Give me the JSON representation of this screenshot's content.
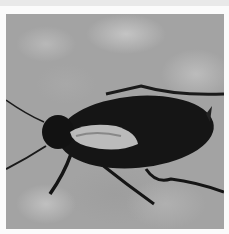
{
  "image": {
    "subject": "cockroach",
    "description": "Black-and-white photograph of a dark cockroach on a mottled stone surface, with a white border frame",
    "colors": {
      "border": "#fbfbfb",
      "surface": "#a3a3a3",
      "insect_body": "#151515",
      "highlight": "#e6e6e6"
    }
  }
}
